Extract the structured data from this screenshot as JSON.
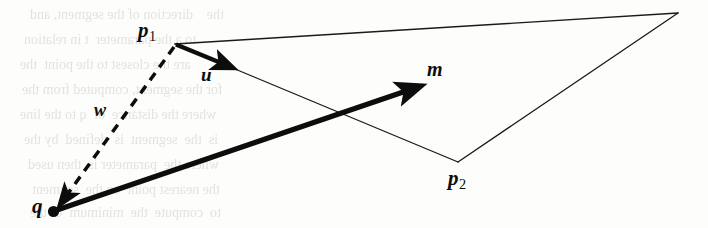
{
  "figure": {
    "kind": "vector-geometry-diagram",
    "width": 708,
    "height": 228,
    "background_color": "#fdfdfc",
    "ink_color": "#0d0d0d",
    "ghost_color": "#d9d9d6"
  },
  "labels": {
    "p1": {
      "base": "p",
      "sub": "1"
    },
    "p2": {
      "base": "p",
      "sub": "2"
    },
    "q": "q",
    "u": "u",
    "w": "w",
    "m": "m"
  },
  "points": {
    "p1": {
      "x": 175,
      "y": 44,
      "label": "p1"
    },
    "p2": {
      "x": 458,
      "y": 162,
      "label": "p2"
    },
    "q": {
      "x": 53,
      "y": 212,
      "label": "q",
      "marker": "filled-dot"
    },
    "apex": {
      "x": 678,
      "y": 13,
      "label": ""
    },
    "u_tip": {
      "x": 233,
      "y": 69
    },
    "m_tip": {
      "x": 426,
      "y": 85
    }
  },
  "thin_lines": [
    {
      "name": "p1-to-apex",
      "from": "p1",
      "to": "apex",
      "stroke_width": 1.3
    },
    {
      "name": "apex-to-p2",
      "from": "apex",
      "to": "p2",
      "stroke_width": 1.3
    },
    {
      "name": "p1-to-p2",
      "from": "p1",
      "to": "p2",
      "stroke_width": 1.3
    }
  ],
  "vectors": [
    {
      "name": "u",
      "label": "u",
      "from": "p1",
      "to": "u_tip",
      "style": "solid-bold-arrow",
      "stroke_width": 4.2
    },
    {
      "name": "m",
      "label": "m",
      "from": "q",
      "to": "m_tip",
      "style": "solid-bold-arrow",
      "stroke_width": 5.2
    },
    {
      "name": "w",
      "label": "w",
      "from": "p1",
      "to": "q",
      "style": "dashed-arrow",
      "stroke_width": 3.4,
      "dash_pattern": "9 7"
    }
  ],
  "ghost_text": {
    "note": "faint bleed-through text from reverse page, illegible",
    "lines": [
      {
        "x": 30,
        "y": 12,
        "text": "the    direction of the segment, and"
      },
      {
        "x": 24,
        "y": 37,
        "text": "to a the parameter  t in relation"
      },
      {
        "x": 20,
        "y": 62,
        "text": "are the closest to the point  the"
      },
      {
        "x": 22,
        "y": 87,
        "text": "for the segment, computed from the"
      },
      {
        "x": 20,
        "y": 112,
        "text": "where the distance  of  q to the line"
      },
      {
        "x": 24,
        "y": 137,
        "text": "is  the  segment  is  defined  by the"
      },
      {
        "x": 28,
        "y": 162,
        "text": "where the  parameter is  then used"
      },
      {
        "x": 32,
        "y": 187,
        "text": "the nearest point  on the  segment"
      },
      {
        "x": 30,
        "y": 210,
        "text": "to  compute  the  minimum  of the"
      }
    ]
  }
}
